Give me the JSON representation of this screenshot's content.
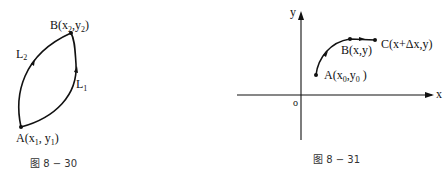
{
  "figures": [
    {
      "id": "fig-8-30",
      "caption": "图 8 − 30",
      "points": {
        "A": {
          "name": "A",
          "coord": "(x",
          "x_sub": "1",
          "sep": ", y",
          "y_sub": "1",
          "close": ")"
        },
        "B": {
          "name": "B",
          "coord": "(x",
          "x_sub": "2",
          "sep": ",y",
          "y_sub": "2",
          "close": ")"
        }
      },
      "curves": {
        "L1": {
          "name": "L",
          "sub": "1"
        },
        "L2": {
          "name": "L",
          "sub": "2"
        }
      }
    },
    {
      "id": "fig-8-31",
      "caption": "图 8 − 31",
      "axes": {
        "x": "x",
        "y": "y",
        "origin": "o"
      },
      "points": {
        "A": {
          "name": "A",
          "coord": "(x",
          "x_sub": "0",
          "sep": ",y",
          "y_sub": "0",
          "close": " )"
        },
        "B": {
          "label": "B(x,y)"
        },
        "C": {
          "label": "C(x+Δx,y)"
        }
      }
    }
  ]
}
